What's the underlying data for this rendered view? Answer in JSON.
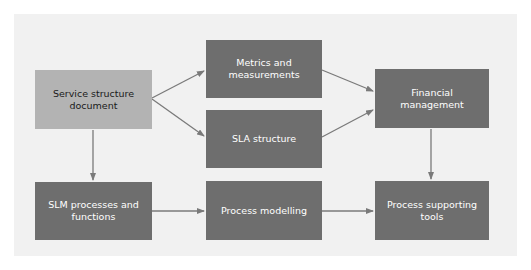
{
  "diagram": {
    "background_color": "#f1f1f1",
    "node_color_primary": "#6e6e6e",
    "node_color_highlight": "#b3b3b3",
    "arrow_color": "#7a7a7a",
    "nodes": {
      "service_structure": {
        "label": "Service structure document"
      },
      "metrics": {
        "label": "Metrics and measurements"
      },
      "sla_structure": {
        "label": "SLA structure"
      },
      "financial": {
        "label": "Financial management"
      },
      "slm_processes": {
        "label": "SLM processes and functions"
      },
      "process_modelling": {
        "label": "Process modelling"
      },
      "process_tools": {
        "label": "Process supporting tools"
      }
    },
    "edges": [
      {
        "from": "Service structure document",
        "to": "Metrics and measurements"
      },
      {
        "from": "Service structure document",
        "to": "SLA structure"
      },
      {
        "from": "Service structure document",
        "to": "SLM processes and functions"
      },
      {
        "from": "Metrics and measurements",
        "to": "Financial management"
      },
      {
        "from": "SLA structure",
        "to": "Financial management"
      },
      {
        "from": "Financial management",
        "to": "Process supporting tools"
      },
      {
        "from": "SLM processes and functions",
        "to": "Process modelling"
      },
      {
        "from": "Process modelling",
        "to": "Process supporting tools"
      }
    ]
  }
}
